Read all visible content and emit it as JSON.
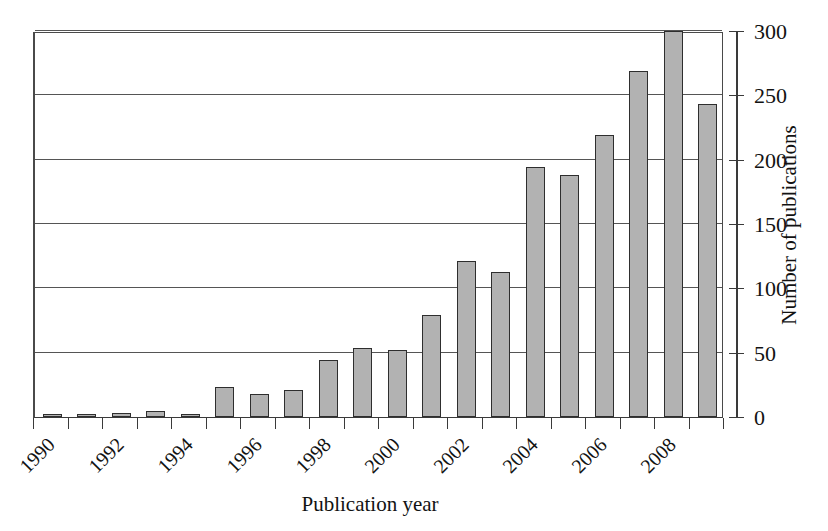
{
  "chart_data": {
    "type": "bar",
    "title": "",
    "xlabel": "Publication year",
    "ylabel": "Number of publications",
    "categories": [
      "1990",
      "1991",
      "1992",
      "1993",
      "1994",
      "1995",
      "1996",
      "1997",
      "1998",
      "1999",
      "2000",
      "2001",
      "2002",
      "2003",
      "2004",
      "2005",
      "2006",
      "2007",
      "2008",
      "2009"
    ],
    "values": [
      1,
      2,
      3,
      5,
      2,
      23,
      18,
      21,
      44,
      54,
      52,
      79,
      121,
      113,
      194,
      188,
      219,
      269,
      300,
      243
    ],
    "ylim": [
      0,
      300
    ],
    "ytick_values": [
      0,
      50,
      100,
      150,
      200,
      250,
      300
    ],
    "ytick_labels": [
      "0",
      "50",
      "100",
      "150",
      "200",
      "250",
      "300"
    ],
    "xtick_labels_shown": [
      "1990",
      "1992",
      "1994",
      "1996",
      "1998",
      "2000",
      "2002",
      "2004",
      "2006",
      "2008"
    ],
    "xtick_label_rotation": -45,
    "grid": "horizontal",
    "legend": "none",
    "y_axis_position": "right",
    "bar_fill_color": "#b2b2b2",
    "bar_edge_color": "#2e2e2e",
    "grid_color": "#555555",
    "axis_color": "#3a3a3a",
    "background_color": "#ffffff"
  }
}
